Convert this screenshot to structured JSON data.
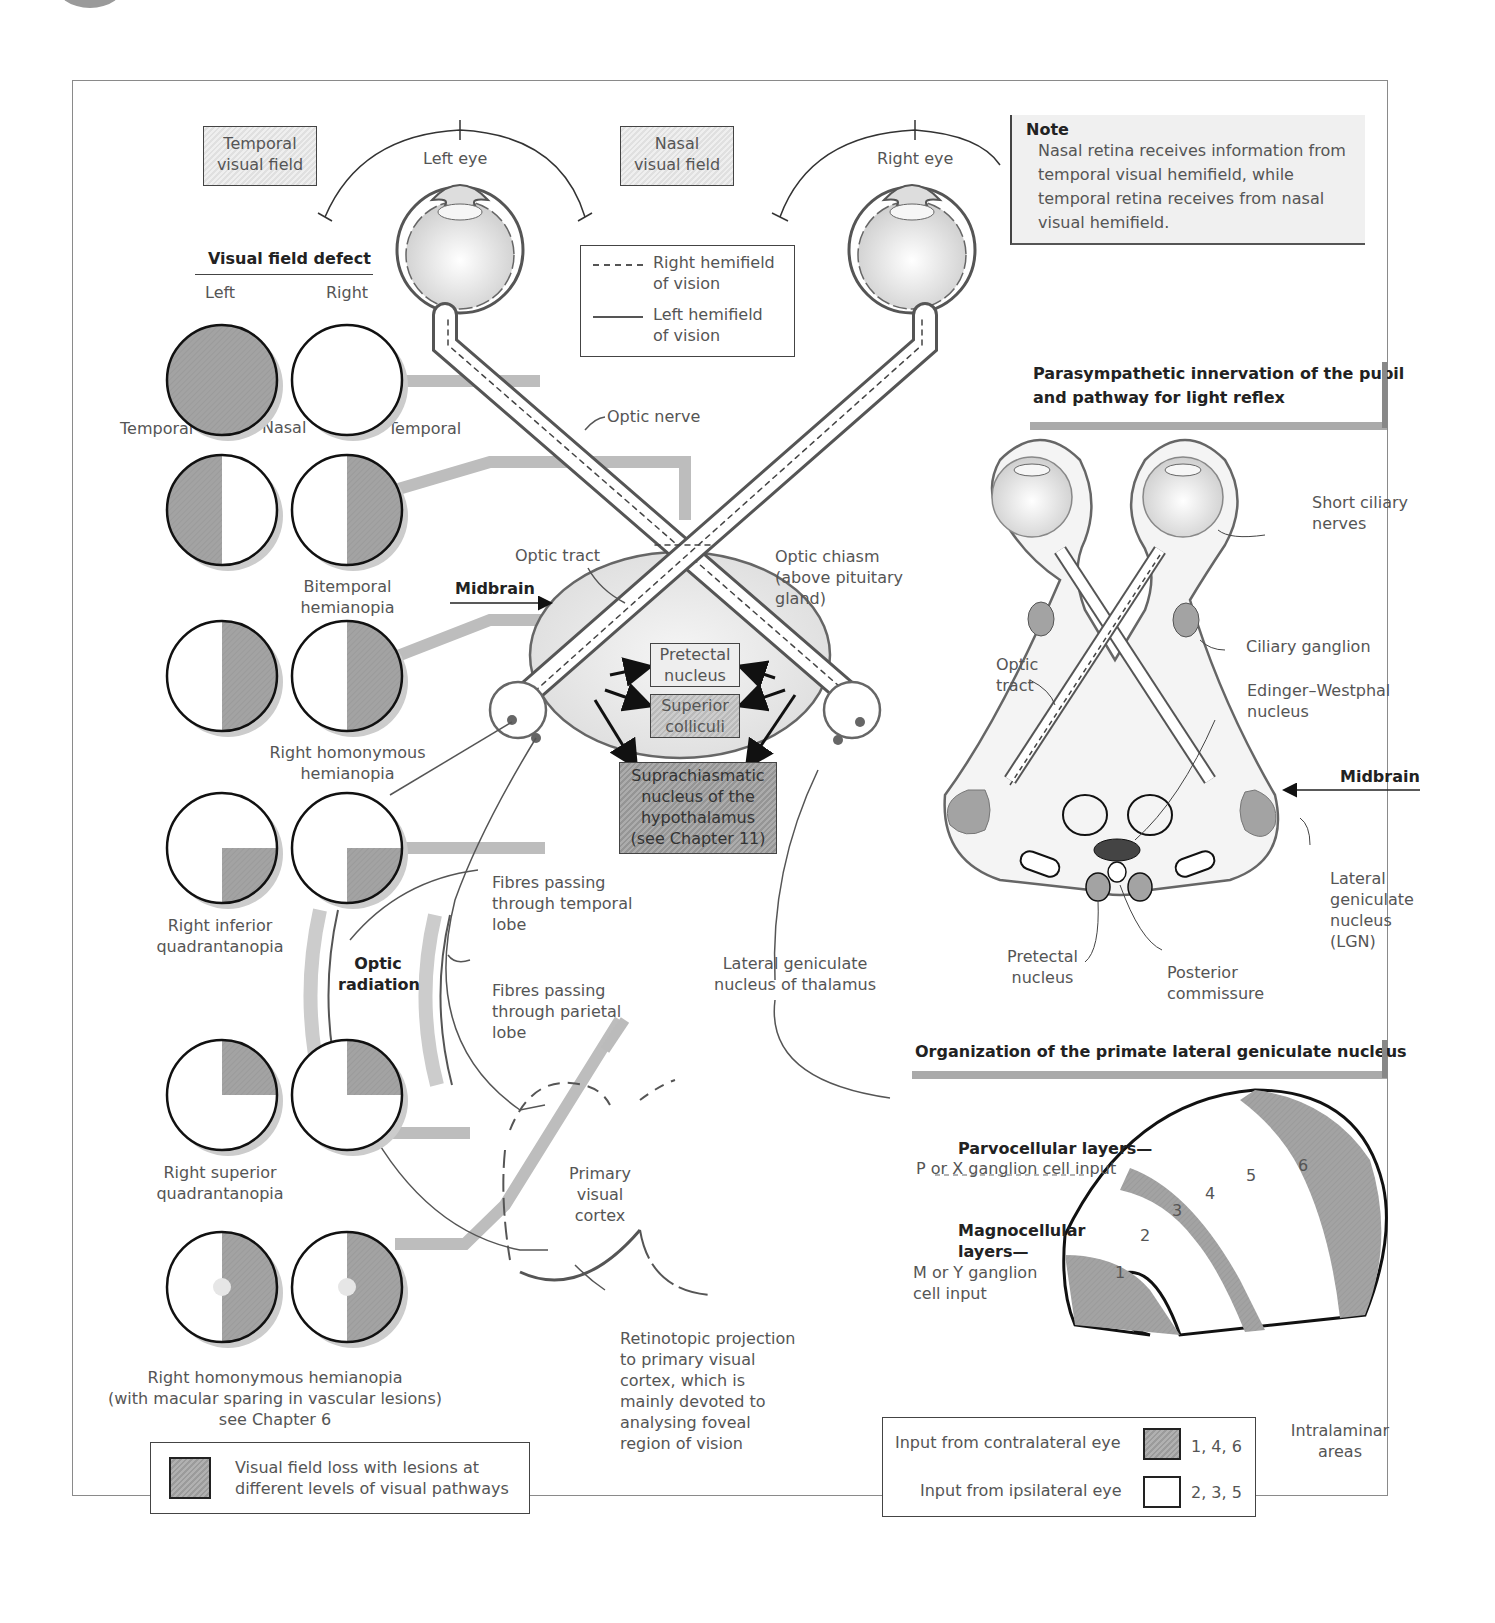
{
  "header": {
    "title_fragment": "and subcortical visual areas"
  },
  "colors": {
    "loss_gray": "#a0a0a0",
    "line_dark": "#444444",
    "dark_nucleus": "#444444",
    "light_fill": "#e8e8e8"
  },
  "top": {
    "temporal_field": [
      "Temporal",
      "visual field"
    ],
    "nasal_field": [
      "Nasal",
      "visual field"
    ],
    "left_eye": "Left eye",
    "right_eye": "Right eye",
    "line_legend": {
      "dashed": [
        "Right hemifield",
        "of vision"
      ],
      "solid": [
        "Left hemifield",
        "of vision"
      ]
    }
  },
  "note": {
    "title": "Note",
    "lines": [
      "Nasal retina receives information from",
      "temporal visual hemifield, while",
      "temporal retina receives from nasal",
      "visual hemifield."
    ]
  },
  "visual_field_defect": {
    "heading": "Visual field defect",
    "col_left": "Left",
    "col_right": "Right",
    "side_labels": [
      "Temporal",
      "Nasal",
      "Temporal"
    ],
    "rows": [
      {
        "left": "full",
        "right": "none",
        "caption": []
      },
      {
        "left": "left-half",
        "right": "right-half",
        "caption": [
          "Bitemporal",
          "hemianopia"
        ]
      },
      {
        "left": "right-half",
        "right": "right-half",
        "caption": [
          "Right homonymous",
          "hemianopia"
        ]
      },
      {
        "left": "lower-right",
        "right": "lower-right",
        "caption": [
          "Right inferior",
          "quadrantanopia"
        ]
      },
      {
        "left": "upper-right",
        "right": "upper-right",
        "caption": [
          "Right superior",
          "quadrantanopia"
        ]
      },
      {
        "left": "right-half-spared",
        "right": "right-half-spared",
        "caption": [
          "Right homonymous hemianopia",
          "(with macular sparing in vascular lesions)",
          "see Chapter 6"
        ]
      }
    ],
    "legend": [
      "Visual field loss with lesions at",
      "different levels of visual pathways"
    ]
  },
  "pathway": {
    "optic_nerve": "Optic nerve",
    "optic_tract": "Optic tract",
    "optic_chiasm": [
      "Optic chiasm",
      "(above pituitary",
      "gland)"
    ],
    "midbrain": "Midbrain",
    "pretectal": [
      "Pretectal",
      "nucleus"
    ],
    "superior": [
      "Superior",
      "colliculi"
    ],
    "suprachiasmatic": [
      "Suprachiasmatic",
      "nucleus of the",
      "hypothalamus",
      "(see Chapter 11)"
    ],
    "fibres_temporal": [
      "Fibres passing",
      "through temporal",
      "lobe"
    ],
    "fibres_parietal": [
      "Fibres passing",
      "through parietal",
      "lobe"
    ],
    "optic_radiation": [
      "Optic",
      "radiation"
    ],
    "lgn_thalamus": [
      "Lateral geniculate",
      "nucleus of thalamus"
    ],
    "primary_cortex": [
      "Primary",
      "visual",
      "cortex"
    ],
    "retinotopic": [
      "Retinotopic projection",
      "to primary visual",
      "cortex, which is",
      "mainly devoted to",
      "analysing foveal",
      "region of vision"
    ]
  },
  "parasympathetic": {
    "heading": [
      "Parasympathetic innervation of the pupil",
      "and pathway for light reflex"
    ],
    "short_ciliary": [
      "Short ciliary",
      "nerves"
    ],
    "ciliary_ganglion": "Ciliary ganglion",
    "optic_tract": [
      "Optic",
      "tract"
    ],
    "edinger": [
      "Edinger–Westphal",
      "nucleus"
    ],
    "midbrain": "Midbrain",
    "lgn": [
      "Lateral",
      "geniculate",
      "nucleus",
      "(LGN)"
    ],
    "pretectal": [
      "Pretectal",
      "nucleus"
    ],
    "posterior": [
      "Posterior",
      "commissure"
    ]
  },
  "lgn_org": {
    "heading": "Organization of the primate lateral geniculate nucleus",
    "parvo_title": "Parvocellular layers—",
    "parvo_sub": "P or X ganglion cell input",
    "magno_title": [
      "Magnocellular",
      "layers—"
    ],
    "magno_sub": [
      "M or Y ganglion",
      "cell input"
    ],
    "layers": [
      "1",
      "2",
      "3",
      "4",
      "5",
      "6"
    ],
    "intralaminar": [
      "Intralaminar",
      "areas"
    ],
    "legend": [
      {
        "label": "Input from contralateral eye",
        "layers": "1, 4, 6",
        "fill": "gray"
      },
      {
        "label": "Input from ipsilateral eye",
        "layers": "2, 3, 5",
        "fill": "white"
      }
    ]
  }
}
